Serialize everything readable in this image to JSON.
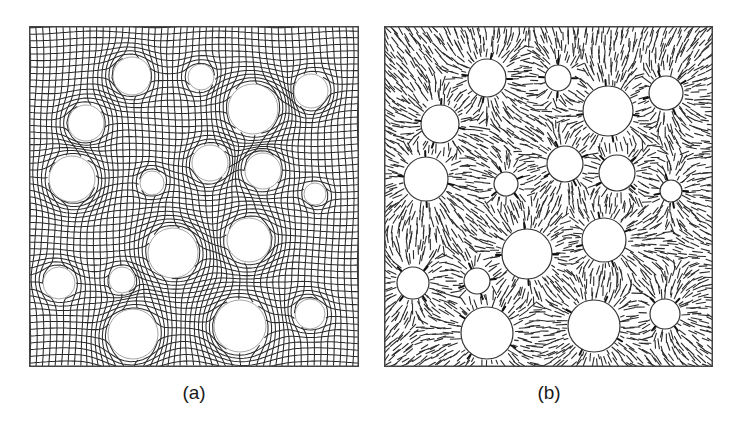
{
  "figure": {
    "background": "#ffffff",
    "line_color": "#2a2a2a",
    "border_color": "#444444",
    "panels": [
      {
        "id": "a",
        "label": "(a)",
        "type": "deformed-quad-mesh",
        "description": "Mesh lines bending around circular inclusions",
        "box": {
          "x": 29,
          "y": 26,
          "w": 330,
          "h": 341
        },
        "label_pos": {
          "x": 194,
          "y": 383
        },
        "cell_size": 6.6,
        "circles": [
          {
            "cx": 132,
            "cy": 76,
            "r": 19
          },
          {
            "cx": 201,
            "cy": 77,
            "r": 13
          },
          {
            "cx": 253,
            "cy": 109,
            "r": 25
          },
          {
            "cx": 311,
            "cy": 91,
            "r": 17
          },
          {
            "cx": 86,
            "cy": 123,
            "r": 18
          },
          {
            "cx": 72,
            "cy": 179,
            "r": 23
          },
          {
            "cx": 152,
            "cy": 183,
            "r": 12
          },
          {
            "cx": 210,
            "cy": 163,
            "r": 18
          },
          {
            "cx": 263,
            "cy": 171,
            "r": 18
          },
          {
            "cx": 315,
            "cy": 194,
            "r": 11
          },
          {
            "cx": 173,
            "cy": 253,
            "r": 25
          },
          {
            "cx": 249,
            "cy": 240,
            "r": 22
          },
          {
            "cx": 59,
            "cy": 283,
            "r": 16
          },
          {
            "cx": 122,
            "cy": 280,
            "r": 13
          },
          {
            "cx": 133,
            "cy": 334,
            "r": 25
          },
          {
            "cx": 240,
            "cy": 326,
            "r": 26
          },
          {
            "cx": 310,
            "cy": 314,
            "r": 15
          }
        ]
      },
      {
        "id": "b",
        "label": "(b)",
        "type": "radial-director-field",
        "description": "Short line segments oriented radially around circular inclusions",
        "box": {
          "x": 384,
          "y": 26,
          "w": 329,
          "h": 341
        },
        "label_pos": {
          "x": 549,
          "y": 383
        },
        "segment_spacing": 6.2,
        "segment_length": 9,
        "circles": [
          {
            "cx": 487,
            "cy": 78,
            "r": 19
          },
          {
            "cx": 558,
            "cy": 78,
            "r": 13
          },
          {
            "cx": 608,
            "cy": 111,
            "r": 25
          },
          {
            "cx": 666,
            "cy": 93,
            "r": 17
          },
          {
            "cx": 440,
            "cy": 124,
            "r": 19
          },
          {
            "cx": 426,
            "cy": 179,
            "r": 22
          },
          {
            "cx": 506,
            "cy": 184,
            "r": 12
          },
          {
            "cx": 565,
            "cy": 164,
            "r": 18
          },
          {
            "cx": 617,
            "cy": 173,
            "r": 18
          },
          {
            "cx": 671,
            "cy": 191,
            "r": 11
          },
          {
            "cx": 527,
            "cy": 254,
            "r": 25
          },
          {
            "cx": 604,
            "cy": 240,
            "r": 22
          },
          {
            "cx": 413,
            "cy": 283,
            "r": 16
          },
          {
            "cx": 477,
            "cy": 281,
            "r": 13
          },
          {
            "cx": 487,
            "cy": 333,
            "r": 26
          },
          {
            "cx": 594,
            "cy": 326,
            "r": 26
          },
          {
            "cx": 665,
            "cy": 314,
            "r": 15
          }
        ]
      }
    ]
  }
}
